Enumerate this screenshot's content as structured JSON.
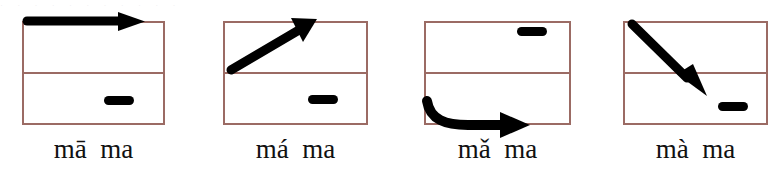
{
  "figure": {
    "top_cropped_text": "· · ·   · ·   ·  · · ·   ·   ·",
    "box_border_color": "#9b6b64",
    "stroke_color": "#000000",
    "background_color": "#ffffff",
    "panels": [
      {
        "id": "tone1",
        "label": "mā  ma",
        "tone_name": "first-tone",
        "contour": "high-level",
        "arrow_icon": "arrow-right-horizontal-icon",
        "arrow_direction": "right",
        "marker_icon": "dash-marker-icon",
        "marker_half": "lower",
        "marker_side": "right",
        "box": {
          "x": 22,
          "y": 21,
          "width": 143,
          "height": 104
        }
      },
      {
        "id": "tone2",
        "label": "má  ma",
        "tone_name": "second-tone",
        "contour": "rising",
        "arrow_icon": "arrow-up-right-diagonal-icon",
        "arrow_direction": "up-right",
        "marker_icon": "dash-marker-icon",
        "marker_half": "lower",
        "marker_side": "right",
        "box": {
          "x": 223,
          "y": 21,
          "width": 145,
          "height": 104
        }
      },
      {
        "id": "tone3",
        "label": "mǎ  ma",
        "tone_name": "third-tone",
        "contour": "falling-rising",
        "arrow_icon": "arrow-curved-dip-right-icon",
        "arrow_direction": "down-then-right",
        "marker_icon": "dash-marker-icon",
        "marker_half": "upper",
        "marker_side": "right",
        "box": {
          "x": 424,
          "y": 21,
          "width": 147,
          "height": 104
        }
      },
      {
        "id": "tone4",
        "label": "mà  ma",
        "tone_name": "fourth-tone",
        "contour": "falling",
        "arrow_icon": "arrow-down-right-diagonal-icon",
        "arrow_direction": "down-right",
        "marker_icon": "dash-marker-icon",
        "marker_half": "lower",
        "marker_side": "right",
        "box": {
          "x": 623,
          "y": 21,
          "width": 145,
          "height": 104
        }
      }
    ]
  }
}
